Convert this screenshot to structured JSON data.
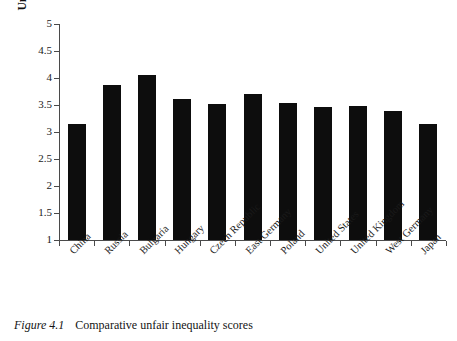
{
  "figure": {
    "caption_label": "Figure 4.1",
    "caption_text": "Comparative unfair inequality scores"
  },
  "chart_data": {
    "type": "bar",
    "title": "",
    "xlabel": "",
    "ylabel": "Unfair inequality average score",
    "ylim": [
      1,
      5
    ],
    "ytick_labels": [
      "1",
      "1.5",
      "2",
      "2.5",
      "3",
      "3.5",
      "4",
      "4.5",
      "5"
    ],
    "ytick_values": [
      1,
      1.5,
      2,
      2.5,
      3,
      3.5,
      4,
      4.5,
      5
    ],
    "grid": false,
    "legend": false,
    "bar_color": "#0d0d0d",
    "categories": [
      "China",
      "Russia",
      "Bulgaria",
      "Hungary",
      "Czech Republic",
      "East Germany",
      "Poland",
      "United States",
      "United Kingdom",
      "West Germany",
      "Japan"
    ],
    "values": [
      3.15,
      3.87,
      4.06,
      3.62,
      3.51,
      3.71,
      3.53,
      3.47,
      3.49,
      3.39,
      3.15
    ]
  }
}
